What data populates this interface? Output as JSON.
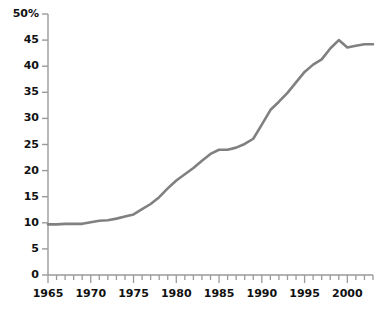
{
  "chart_data": {
    "type": "line",
    "title": "",
    "subtitle": "",
    "xlabel": "",
    "ylabel": "",
    "xlim": [
      1965,
      2003
    ],
    "ylim": [
      0,
      50
    ],
    "grid": false,
    "legend": null,
    "y_tick_labels": [
      "50%",
      "45",
      "40",
      "35",
      "30",
      "25",
      "20",
      "15",
      "10",
      "5",
      "0"
    ],
    "y_ticks": [
      50,
      45,
      40,
      35,
      30,
      25,
      20,
      15,
      10,
      5,
      0
    ],
    "x_tick_labels": [
      "1965",
      "1970",
      "1975",
      "1980",
      "1985",
      "1990",
      "1995",
      "2000"
    ],
    "x_major_ticks": [
      1965,
      1970,
      1975,
      1980,
      1985,
      1990,
      1995,
      2000
    ],
    "x_minor_tick_interval": 1,
    "y_unit": "%",
    "series": [
      {
        "name": "series-1",
        "color": "#808080",
        "x": [
          1965,
          1966,
          1967,
          1968,
          1969,
          1970,
          1971,
          1972,
          1973,
          1974,
          1975,
          1976,
          1977,
          1978,
          1979,
          1980,
          1981,
          1982,
          1983,
          1984,
          1985,
          1986,
          1987,
          1988,
          1989,
          1990,
          1991,
          1992,
          1993,
          1994,
          1995,
          1996,
          1997,
          1998,
          1999,
          2000,
          2001,
          2002,
          2003
        ],
        "values": [
          9.7,
          9.7,
          9.8,
          9.8,
          9.8,
          10.1,
          10.4,
          10.5,
          10.8,
          11.2,
          11.6,
          12.6,
          13.6,
          14.9,
          16.6,
          18.1,
          19.3,
          20.5,
          21.9,
          23.2,
          24.0,
          24.0,
          24.4,
          25.1,
          26.1,
          28.8,
          31.6,
          33.2,
          34.9,
          36.9,
          38.9,
          40.3,
          41.3,
          43.4,
          45.0,
          43.6,
          43.9,
          44.2,
          44.2
        ]
      }
    ]
  },
  "axis": {
    "line_color": "#9a9a9a",
    "tick_color": "#9a9a9a",
    "label_color": "#111111"
  }
}
